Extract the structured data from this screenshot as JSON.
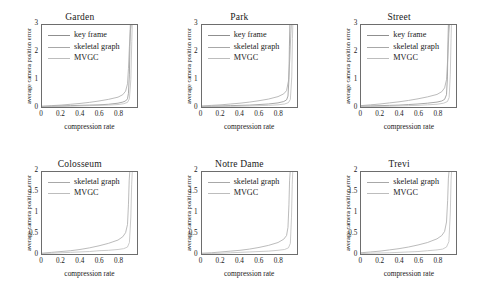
{
  "figure": {
    "background": "#ffffff",
    "axis_color": "#6d6d6d",
    "rows": 2,
    "cols": 3
  },
  "chart_data": [
    {
      "type": "line",
      "title": "Garden",
      "xlabel": "compression rate",
      "ylabel": "average camera position error",
      "xlim": [
        0,
        1
      ],
      "ylim": [
        0,
        3
      ],
      "xticks": [
        0,
        0.2,
        0.4,
        0.6,
        0.8
      ],
      "xticklabels": [
        "0",
        "0.2",
        "0.4",
        "0.6",
        "0.8"
      ],
      "yticks": [
        0,
        1,
        2,
        3
      ],
      "yticklabels": [
        "0",
        "1",
        "2",
        "3"
      ],
      "grid": false,
      "legend_position": "upper left",
      "series": [
        {
          "name": "key frame",
          "color": "#8f8f8f",
          "x": [
            0,
            0.1,
            0.2,
            0.3,
            0.4,
            0.5,
            0.6,
            0.7,
            0.8,
            0.85,
            0.88,
            0.9,
            0.91,
            0.92,
            0.925,
            0.93
          ],
          "values": [
            0.02,
            0.03,
            0.04,
            0.05,
            0.06,
            0.07,
            0.08,
            0.1,
            0.14,
            0.18,
            0.22,
            0.3,
            0.5,
            1.2,
            2.2,
            3.0
          ]
        },
        {
          "name": "skeletal graph",
          "color": "#a8a8a8",
          "x": [
            0,
            0.1,
            0.2,
            0.3,
            0.4,
            0.5,
            0.6,
            0.7,
            0.8,
            0.85,
            0.88,
            0.9,
            0.91,
            0.92,
            0.93,
            0.94
          ],
          "values": [
            0.03,
            0.05,
            0.07,
            0.1,
            0.13,
            0.17,
            0.22,
            0.28,
            0.36,
            0.45,
            0.58,
            0.85,
            1.4,
            2.2,
            2.8,
            3.0
          ]
        },
        {
          "name": "MVGC",
          "color": "#bdbdbd",
          "x": [
            0,
            0.1,
            0.2,
            0.3,
            0.4,
            0.5,
            0.6,
            0.7,
            0.8,
            0.86,
            0.9,
            0.92,
            0.935,
            0.945,
            0.95
          ],
          "values": [
            0.01,
            0.02,
            0.02,
            0.03,
            0.04,
            0.05,
            0.06,
            0.07,
            0.09,
            0.12,
            0.17,
            0.3,
            1.0,
            2.4,
            3.0
          ]
        }
      ]
    },
    {
      "type": "line",
      "title": "Park",
      "xlabel": "compression rate",
      "ylabel": "average camera position error",
      "xlim": [
        0,
        1
      ],
      "ylim": [
        0,
        3
      ],
      "xticks": [
        0,
        0.2,
        0.4,
        0.6,
        0.8
      ],
      "xticklabels": [
        "0",
        "0.2",
        "0.4",
        "0.6",
        "0.8"
      ],
      "yticks": [
        0,
        1,
        2,
        3
      ],
      "yticklabels": [
        "0",
        "1",
        "2",
        "3"
      ],
      "grid": false,
      "legend_position": "upper left",
      "series": [
        {
          "name": "key frame",
          "color": "#8f8f8f",
          "x": [
            0,
            0.1,
            0.2,
            0.3,
            0.4,
            0.5,
            0.6,
            0.7,
            0.8,
            0.86,
            0.89,
            0.905,
            0.915,
            0.92,
            0.925
          ],
          "values": [
            0.02,
            0.03,
            0.04,
            0.05,
            0.06,
            0.07,
            0.09,
            0.11,
            0.15,
            0.2,
            0.26,
            0.4,
            1.0,
            2.2,
            3.0
          ]
        },
        {
          "name": "skeletal graph",
          "color": "#a8a8a8",
          "x": [
            0,
            0.1,
            0.2,
            0.3,
            0.4,
            0.5,
            0.6,
            0.7,
            0.8,
            0.86,
            0.89,
            0.91,
            0.925,
            0.935,
            0.94
          ],
          "values": [
            0.04,
            0.06,
            0.08,
            0.11,
            0.14,
            0.18,
            0.23,
            0.29,
            0.38,
            0.48,
            0.6,
            0.95,
            1.8,
            2.7,
            3.0
          ]
        },
        {
          "name": "MVGC",
          "color": "#bdbdbd",
          "x": [
            0,
            0.1,
            0.2,
            0.3,
            0.4,
            0.5,
            0.6,
            0.7,
            0.8,
            0.87,
            0.91,
            0.93,
            0.945,
            0.952,
            0.956
          ],
          "values": [
            0.01,
            0.015,
            0.02,
            0.025,
            0.03,
            0.04,
            0.05,
            0.06,
            0.08,
            0.11,
            0.16,
            0.28,
            1.1,
            2.5,
            3.0
          ]
        }
      ]
    },
    {
      "type": "line",
      "title": "Street",
      "xlabel": "compression rate",
      "ylabel": "average camera position error",
      "xlim": [
        0,
        1
      ],
      "ylim": [
        0,
        3
      ],
      "xticks": [
        0,
        0.2,
        0.4,
        0.6,
        0.8
      ],
      "xticklabels": [
        "0",
        "0.2",
        "0.4",
        "0.6",
        "0.8"
      ],
      "yticks": [
        0,
        1,
        2,
        3
      ],
      "yticklabels": [
        "0",
        "1",
        "2",
        "3"
      ],
      "grid": false,
      "legend_position": "upper left",
      "series": [
        {
          "name": "key frame",
          "color": "#8f8f8f",
          "x": [
            0,
            0.1,
            0.2,
            0.3,
            0.4,
            0.5,
            0.6,
            0.7,
            0.8,
            0.85,
            0.88,
            0.9,
            0.91,
            0.915,
            0.92
          ],
          "values": [
            0.03,
            0.04,
            0.05,
            0.06,
            0.07,
            0.09,
            0.11,
            0.14,
            0.18,
            0.22,
            0.28,
            0.45,
            1.1,
            2.3,
            3.0
          ]
        },
        {
          "name": "skeletal graph",
          "color": "#a8a8a8",
          "x": [
            0,
            0.1,
            0.2,
            0.3,
            0.4,
            0.5,
            0.6,
            0.7,
            0.8,
            0.85,
            0.88,
            0.9,
            0.915,
            0.925,
            0.932
          ],
          "values": [
            0.05,
            0.08,
            0.11,
            0.15,
            0.19,
            0.24,
            0.3,
            0.37,
            0.46,
            0.56,
            0.7,
            1.0,
            1.9,
            2.7,
            3.0
          ]
        },
        {
          "name": "MVGC",
          "color": "#bdbdbd",
          "x": [
            0,
            0.1,
            0.2,
            0.3,
            0.4,
            0.5,
            0.6,
            0.7,
            0.8,
            0.87,
            0.91,
            0.928,
            0.94,
            0.948,
            0.952
          ],
          "values": [
            0.01,
            0.02,
            0.025,
            0.03,
            0.04,
            0.05,
            0.06,
            0.08,
            0.1,
            0.14,
            0.2,
            0.35,
            1.2,
            2.5,
            3.0
          ]
        }
      ]
    },
    {
      "type": "line",
      "title": "Colosseum",
      "xlabel": "compression rate",
      "ylabel": "average camera position error",
      "xlim": [
        0,
        1
      ],
      "ylim": [
        0,
        2
      ],
      "xticks": [
        0,
        0.2,
        0.4,
        0.6,
        0.8
      ],
      "xticklabels": [
        "0",
        "0.2",
        "0.4",
        "0.6",
        "0.8"
      ],
      "yticks": [
        0,
        0.5,
        1,
        1.5,
        2
      ],
      "yticklabels": [
        "0",
        "0.5",
        "1",
        "1.5",
        "2"
      ],
      "grid": false,
      "legend_position": "upper left",
      "series": [
        {
          "name": "skeletal graph",
          "color": "#a8a8a8",
          "x": [
            0,
            0.1,
            0.2,
            0.3,
            0.4,
            0.5,
            0.6,
            0.7,
            0.8,
            0.85,
            0.88,
            0.9,
            0.91,
            0.918,
            0.924
          ],
          "values": [
            0.02,
            0.04,
            0.06,
            0.08,
            0.11,
            0.15,
            0.2,
            0.26,
            0.34,
            0.42,
            0.52,
            0.72,
            1.2,
            1.8,
            2.0
          ]
        },
        {
          "name": "MVGC",
          "color": "#bdbdbd",
          "x": [
            0,
            0.1,
            0.2,
            0.3,
            0.4,
            0.5,
            0.6,
            0.7,
            0.8,
            0.86,
            0.9,
            0.92,
            0.935,
            0.944,
            0.95
          ],
          "values": [
            0.01,
            0.02,
            0.03,
            0.04,
            0.05,
            0.06,
            0.08,
            0.09,
            0.11,
            0.13,
            0.17,
            0.28,
            0.9,
            1.7,
            2.0
          ]
        }
      ]
    },
    {
      "type": "line",
      "title": "Notre Dame",
      "xlabel": "compression rate",
      "ylabel": "average camera position error",
      "xlim": [
        0,
        1
      ],
      "ylim": [
        0,
        2
      ],
      "xticks": [
        0,
        0.2,
        0.4,
        0.6,
        0.8
      ],
      "xticklabels": [
        "0",
        "0.2",
        "0.4",
        "0.6",
        "0.8"
      ],
      "yticks": [
        0,
        0.5,
        1,
        1.5,
        2
      ],
      "yticklabels": [
        "0",
        "0.5",
        "1",
        "1.5",
        "2"
      ],
      "grid": false,
      "legend_position": "upper left",
      "series": [
        {
          "name": "skeletal graph",
          "color": "#a8a8a8",
          "x": [
            0,
            0.1,
            0.2,
            0.3,
            0.4,
            0.5,
            0.6,
            0.7,
            0.8,
            0.86,
            0.89,
            0.905,
            0.915,
            0.922,
            0.928
          ],
          "values": [
            0.02,
            0.03,
            0.05,
            0.07,
            0.09,
            0.12,
            0.16,
            0.21,
            0.28,
            0.36,
            0.45,
            0.65,
            1.2,
            1.8,
            2.0
          ]
        },
        {
          "name": "MVGC",
          "color": "#bdbdbd",
          "x": [
            0,
            0.1,
            0.2,
            0.3,
            0.4,
            0.5,
            0.6,
            0.7,
            0.8,
            0.87,
            0.91,
            0.93,
            0.942,
            0.95,
            0.955
          ],
          "values": [
            0.01,
            0.015,
            0.02,
            0.03,
            0.04,
            0.05,
            0.06,
            0.07,
            0.09,
            0.11,
            0.15,
            0.26,
            0.9,
            1.7,
            2.0
          ]
        }
      ]
    },
    {
      "type": "line",
      "title": "Trevi",
      "xlabel": "compression rate",
      "ylabel": "average camera position error",
      "xlim": [
        0,
        1
      ],
      "ylim": [
        0,
        2
      ],
      "xticks": [
        0,
        0.2,
        0.4,
        0.6,
        0.8
      ],
      "xticklabels": [
        "0",
        "0.2",
        "0.4",
        "0.6",
        "0.8"
      ],
      "yticks": [
        0,
        0.5,
        1,
        1.5,
        2
      ],
      "yticklabels": [
        "0",
        "0.5",
        "1",
        "1.5",
        "2"
      ],
      "grid": false,
      "legend_position": "upper left",
      "series": [
        {
          "name": "skeletal graph",
          "color": "#a8a8a8",
          "x": [
            0,
            0.1,
            0.2,
            0.3,
            0.4,
            0.5,
            0.6,
            0.7,
            0.8,
            0.85,
            0.88,
            0.9,
            0.912,
            0.92,
            0.926
          ],
          "values": [
            0.03,
            0.05,
            0.07,
            0.1,
            0.13,
            0.17,
            0.22,
            0.28,
            0.37,
            0.45,
            0.55,
            0.78,
            1.3,
            1.85,
            2.0
          ]
        },
        {
          "name": "MVGC",
          "color": "#bdbdbd",
          "x": [
            0,
            0.1,
            0.2,
            0.3,
            0.4,
            0.5,
            0.6,
            0.7,
            0.8,
            0.86,
            0.9,
            0.925,
            0.94,
            0.948,
            0.953
          ],
          "values": [
            0.01,
            0.02,
            0.025,
            0.03,
            0.04,
            0.05,
            0.06,
            0.08,
            0.1,
            0.12,
            0.17,
            0.3,
            1.0,
            1.8,
            2.0
          ]
        }
      ]
    }
  ]
}
